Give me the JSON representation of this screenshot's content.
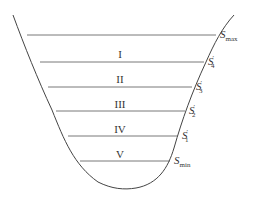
{
  "diagram": {
    "type": "reservoir-cross-section",
    "stroke_color": "#444444",
    "zones": [
      {
        "label": "I",
        "x": 120,
        "y": 58
      },
      {
        "label": "II",
        "x": 120,
        "y": 83
      },
      {
        "label": "III",
        "x": 120,
        "y": 108
      },
      {
        "label": "IV",
        "x": 120,
        "y": 133
      },
      {
        "label": "V",
        "x": 120,
        "y": 158
      }
    ],
    "levels": [
      {
        "id": "smax",
        "base": "S",
        "sub": "max",
        "prime": "",
        "y": 35,
        "x1": 27,
        "x2": 216
      },
      {
        "id": "s4",
        "base": "S",
        "sub": "4",
        "prime": "′",
        "y": 62,
        "x1": 40,
        "x2": 204
      },
      {
        "id": "s3",
        "base": "S",
        "sub": "3",
        "prime": "′",
        "y": 87,
        "x1": 48,
        "x2": 192
      },
      {
        "id": "s2",
        "base": "S",
        "sub": "2",
        "prime": "′",
        "y": 111,
        "x1": 56,
        "x2": 185
      },
      {
        "id": "s1",
        "base": "S",
        "sub": "1",
        "prime": "′",
        "y": 136,
        "x1": 68,
        "x2": 178
      },
      {
        "id": "smin",
        "base": "S",
        "sub": "min",
        "prime": "",
        "y": 161,
        "x1": 80,
        "x2": 170
      }
    ]
  }
}
